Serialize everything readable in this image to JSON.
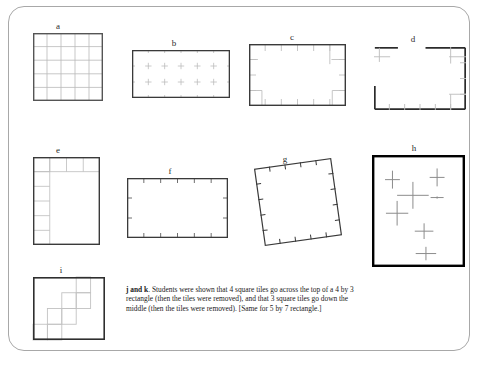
{
  "page": {
    "background_color": "#ffffff",
    "frame_border_color": "#a8a8a8"
  },
  "figures": [
    {
      "id": "a",
      "label": "a",
      "description": "5 by 5 full grid rectangle",
      "type": "full-grid",
      "cols": 5,
      "rows": 5,
      "x": 33,
      "y": 33,
      "width": 70,
      "height": 68,
      "label_x": 58,
      "label_y": 21,
      "border_color": "#555555",
      "grid_color": "#b9b9b9",
      "border_width": 1.4
    },
    {
      "id": "b",
      "label": "b",
      "description": "rectangle with interior lattice cross marks and edge ticks",
      "type": "cross-lattice",
      "cols": 6,
      "rows": 3,
      "x": 132,
      "y": 50,
      "width": 98,
      "height": 48,
      "label_x": 174,
      "label_y": 38,
      "border_color": "#3a3a3a",
      "mark_color": "#bdbdbd",
      "border_width": 1.3
    },
    {
      "id": "c",
      "label": "c",
      "description": "rectangle with inward edge ticks and corner cell marks",
      "type": "edge-ticks-corners",
      "cols": 6,
      "rows": 4,
      "x": 249,
      "y": 44,
      "width": 97,
      "height": 62,
      "label_x": 292,
      "label_y": 32,
      "border_color": "#3a3a3a",
      "mark_color": "#c0c0c0",
      "border_width": 1.4
    },
    {
      "id": "d",
      "label": "d",
      "description": "rectangle with a gap in the top edge, ticks on right and bottom, corner marks",
      "type": "broken-rectangle",
      "cols": 6,
      "rows": 4,
      "x": 374,
      "y": 47,
      "width": 92,
      "height": 63,
      "label_x": 413,
      "label_y": 34,
      "border_color": "#2b2b2b",
      "mark_color": "#bcbcbc",
      "border_width": 1.7,
      "gap_start_fraction": 0.26,
      "gap_end_fraction": 0.56
    },
    {
      "id": "e",
      "label": "e",
      "description": "rectangle with tiles along top row and left column forming an L",
      "type": "l-border-tiles",
      "cols": 4,
      "rows": 6,
      "x": 33,
      "y": 157,
      "width": 67,
      "height": 88,
      "label_x": 58,
      "label_y": 145,
      "border_color": "#3a3a3a",
      "grid_color": "#bcbcbc",
      "border_width": 1.4
    },
    {
      "id": "f",
      "label": "f",
      "description": "plain rectangle with small tick marks on all four edges",
      "type": "edge-ticks-only",
      "cols": 6,
      "rows": 3,
      "x": 127,
      "y": 178,
      "width": 101,
      "height": 60,
      "label_x": 170,
      "label_y": 166,
      "border_color": "#3a3a3a",
      "mark_color": "#6f6f6f",
      "border_width": 1.3
    },
    {
      "id": "g",
      "label": "g",
      "description": "tilted square with tick marks along each edge",
      "type": "tilted-ticks",
      "cols": 5,
      "rows": 5,
      "x": 259,
      "y": 163,
      "width": 78,
      "height": 78,
      "rotation_deg": -8,
      "label_x": 285,
      "label_y": 154,
      "border_color": "#3a3a3a",
      "mark_color": "#3a3a3a",
      "border_width": 1.2
    },
    {
      "id": "h",
      "label": "h",
      "description": "thick bordered rectangle with scattered plus or cross marks inside",
      "type": "scattered-crosses",
      "x": 372,
      "y": 155,
      "width": 93,
      "height": 112,
      "label_x": 414,
      "label_y": 143,
      "border_color": "#000000",
      "mark_color": "#8c8c8c",
      "border_width": 2.4,
      "crosses": [
        {
          "cx": 0.22,
          "cy": 0.22,
          "hw": 0.16,
          "vh": 0.16
        },
        {
          "cx": 0.7,
          "cy": 0.2,
          "hw": 0.16,
          "vh": 0.16
        },
        {
          "cx": 0.44,
          "cy": 0.36,
          "hw": 0.34,
          "vh": 0.24
        },
        {
          "cx": 0.7,
          "cy": 0.38,
          "hw": 0.14,
          "vh": 0.02
        },
        {
          "cx": 0.27,
          "cy": 0.52,
          "hw": 0.24,
          "vh": 0.22
        },
        {
          "cx": 0.56,
          "cy": 0.68,
          "hw": 0.2,
          "vh": 0.14
        },
        {
          "cx": 0.58,
          "cy": 0.88,
          "hw": 0.22,
          "vh": 0.12
        }
      ]
    },
    {
      "id": "i",
      "label": "i",
      "description": "rectangle with a diagonal staircase of square tiles",
      "type": "staircase-tiles",
      "cols": 5,
      "rows": 4,
      "x": 33,
      "y": 277,
      "width": 72,
      "height": 63,
      "label_x": 61,
      "label_y": 265,
      "border_color": "#2f2f2f",
      "grid_color": "#c2c2c2",
      "border_width": 1.6,
      "steps": [
        {
          "col": 0,
          "row": 3
        },
        {
          "col": 1,
          "row": 3
        },
        {
          "col": 1,
          "row": 2
        },
        {
          "col": 2,
          "row": 2
        },
        {
          "col": 2,
          "row": 1
        },
        {
          "col": 3,
          "row": 1
        },
        {
          "col": 3,
          "row": 0
        }
      ]
    }
  ],
  "note": {
    "id": "j-and-k",
    "lead": "j and k",
    "lead_suffix": ".",
    "text": " Students were shown that 4 square tiles go across the top of a 4 by 3 rectangle (then the tiles were removed), and that 3 square tiles go down the middle (then the tiles were removed).  [Same for 5 by 7 rectangle.]",
    "x": 126,
    "y": 285,
    "width": 244
  }
}
